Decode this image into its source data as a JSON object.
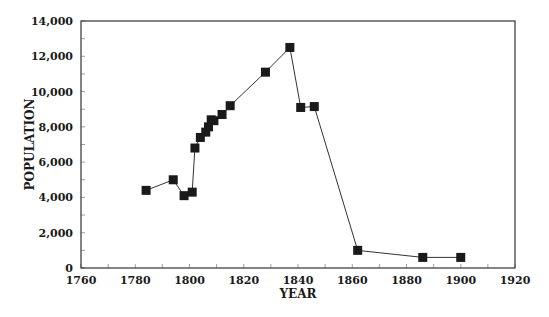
{
  "chart_data": {
    "type": "line",
    "title": "",
    "xlabel": "YEAR",
    "ylabel": "POPULATION",
    "xlim": [
      1760,
      1920
    ],
    "ylim": [
      0,
      14000
    ],
    "grid": false,
    "legend": null,
    "x_ticks": [
      1760,
      1780,
      1800,
      1820,
      1840,
      1860,
      1880,
      1900,
      1920
    ],
    "x_tick_labels": [
      "1760",
      "1780",
      "1800",
      "1820",
      "1840",
      "1860",
      "1880",
      "1900",
      "1920"
    ],
    "y_ticks": [
      0,
      2000,
      4000,
      6000,
      8000,
      10000,
      12000,
      14000
    ],
    "y_tick_labels": [
      "0",
      "2,000",
      "4,000",
      "6,000",
      "8,000",
      "10,000",
      "12,000",
      "14,000"
    ],
    "marker": "square",
    "series": [
      {
        "name": "Population",
        "color": "#1a1a1a",
        "x": [
          1784,
          1794,
          1798,
          1801,
          1802,
          1804,
          1806,
          1807,
          1808,
          1809,
          1812,
          1815,
          1828,
          1837,
          1841,
          1846,
          1862,
          1886,
          1900
        ],
        "values": [
          4400,
          5000,
          4100,
          4300,
          6800,
          7400,
          7700,
          8000,
          8400,
          8350,
          8700,
          9200,
          11100,
          12500,
          9100,
          9150,
          1000,
          600,
          600
        ]
      }
    ]
  },
  "plot": {
    "left": 81,
    "right": 515,
    "top": 21,
    "bottom": 268,
    "minor_x_every": 10,
    "minor_y_every": 1000
  }
}
